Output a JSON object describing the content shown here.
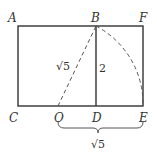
{
  "diagram": {
    "points": {
      "A": "A",
      "B": "B",
      "F": "F",
      "C": "C",
      "O": "O",
      "D": "D",
      "E": "E"
    },
    "labels": {
      "ob_length": "√5",
      "bd_length": "2",
      "oe_length": "√5"
    },
    "colors": {
      "stroke": "#333333",
      "background": "#ffffff"
    }
  }
}
